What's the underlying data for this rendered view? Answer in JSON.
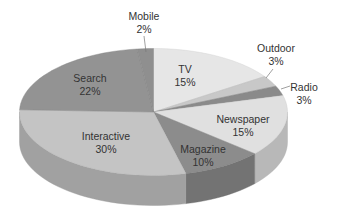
{
  "chart_data": {
    "type": "pie",
    "style": "3d",
    "title": "",
    "unit": "%",
    "categories": [
      "TV",
      "Outdoor",
      "Radio",
      "Newspaper",
      "Magazine",
      "Interactive",
      "Search",
      "Mobile"
    ],
    "values": [
      15,
      3,
      3,
      15,
      10,
      30,
      22,
      2
    ],
    "labels": [
      {
        "name": "TV",
        "value": "15%"
      },
      {
        "name": "Outdoor",
        "value": "3%"
      },
      {
        "name": "Radio",
        "value": "3%"
      },
      {
        "name": "Newspaper",
        "value": "15%"
      },
      {
        "name": "Magazine",
        "value": "10%"
      },
      {
        "name": "Interactive",
        "value": "30%"
      },
      {
        "name": "Search",
        "value": "22%"
      },
      {
        "name": "Mobile",
        "value": "2%"
      }
    ],
    "colors": [
      "#e6e6e6",
      "#c8c8c8",
      "#8a8a8a",
      "#e0e0e0",
      "#8c8c8c",
      "#c4c4c4",
      "#939393",
      "#8f8f8f"
    ],
    "legend": "none",
    "labels_position": "inside_with_leaders_for_small_slices"
  }
}
